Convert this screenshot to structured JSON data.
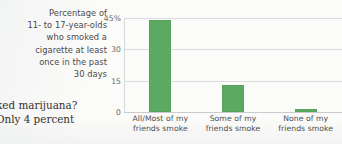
{
  "caption": {
    "lines": [
      "Percentage of",
      "11- to 17-year-olds",
      "who smoked a",
      "cigarette at least",
      "once in the past",
      "30 days"
    ]
  },
  "bodycopy": {
    "lines": [
      "ked marijuana?",
      "Only 4 percent"
    ]
  },
  "chart_data": {
    "type": "bar",
    "title": "Percentage of 11- to 17-year-olds who smoked a cigarette at least once in the past 30 days",
    "xlabel": "",
    "ylabel": "",
    "categories": [
      "All/Most of my friends smoke",
      "Some of my friends smoke",
      "None of my friends smoke"
    ],
    "category_lines": [
      [
        "All/Most of my",
        "friends smoke"
      ],
      [
        "Some of my",
        "friends smoke"
      ],
      [
        "None of my",
        "friends smoke"
      ]
    ],
    "values": [
      44,
      13,
      1.5
    ],
    "ylim": [
      0,
      45
    ],
    "yticks": [
      0,
      15,
      30,
      45
    ],
    "ytick_labels": [
      "0",
      "15",
      "30",
      "45%"
    ],
    "grid": true,
    "legend": "none",
    "bar_color": "#5baa62"
  }
}
